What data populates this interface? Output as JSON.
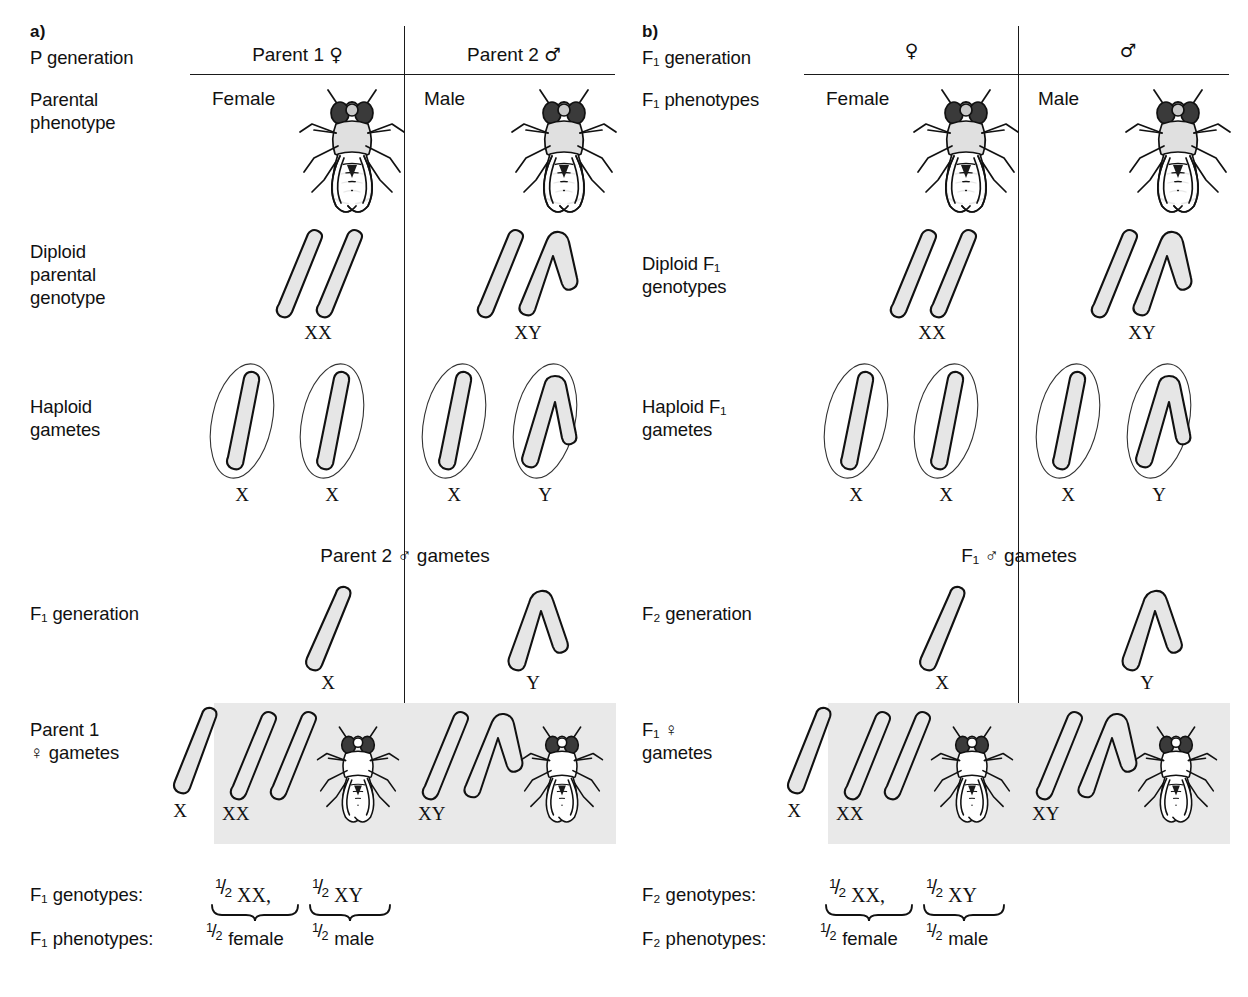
{
  "figure": {
    "background_color": "#ffffff",
    "line_color": "#1a1a1a",
    "punnett_fill": "#e9e9e9",
    "chromosome_fill": "#e3e3e3"
  },
  "panel_a": {
    "letter": "a)",
    "rows": {
      "generation_label": "P generation",
      "phenotype_label": "Parental\nphenotype",
      "diploid_label": "Diploid\nparental\ngenotype",
      "haploid_label": "Haploid\ngametes",
      "cross_generation_label": "F₁ generation",
      "cross_gamete_label": "Parent 1\n♀ gametes"
    },
    "columns": [
      {
        "header_text": "Parent 1",
        "header_symbol": "♀",
        "phenotype": "Female",
        "diploid_genotype": "XX",
        "gametes": [
          "X",
          "X"
        ]
      },
      {
        "header_text": "Parent 2",
        "header_symbol": "♂",
        "phenotype": "Male",
        "diploid_genotype": "XY",
        "gametes": [
          "X",
          "Y"
        ]
      }
    ],
    "punnett": {
      "top_title": "Parent 2 ♂ gametes",
      "top_gametes": [
        "X",
        "Y"
      ],
      "side_gamete": "X",
      "cells": [
        {
          "genotype": "XX",
          "sex": "female"
        },
        {
          "genotype": "XY",
          "sex": "male"
        }
      ]
    },
    "summary": {
      "genotypes_label": "F₁ genotypes:",
      "phenotypes_label": "F₁ phenotypes:",
      "genotypes": [
        {
          "numerator": "1",
          "denominator": "2",
          "text": "XX,"
        },
        {
          "numerator": "1",
          "denominator": "2",
          "text": "XY"
        }
      ],
      "phenotypes": [
        {
          "numerator": "1",
          "denominator": "2",
          "text": "female"
        },
        {
          "numerator": "1",
          "denominator": "2",
          "text": "male"
        }
      ]
    }
  },
  "panel_b": {
    "letter": "b)",
    "rows": {
      "generation_label": "F₁ generation",
      "phenotype_label": "F₁ phenotypes",
      "diploid_label": "Diploid F₁\ngenotypes",
      "haploid_label": "Haploid F₁\ngametes",
      "cross_generation_label": "F₂ generation",
      "cross_gamete_label": "F₁ ♀\ngametes"
    },
    "columns": [
      {
        "header_text": "",
        "header_symbol": "♀",
        "phenotype": "Female",
        "diploid_genotype": "XX",
        "gametes": [
          "X",
          "X"
        ]
      },
      {
        "header_text": "",
        "header_symbol": "♂",
        "phenotype": "Male",
        "diploid_genotype": "XY",
        "gametes": [
          "X",
          "Y"
        ]
      }
    ],
    "punnett": {
      "top_title": "F₁ ♂ gametes",
      "top_gametes": [
        "X",
        "Y"
      ],
      "side_gamete": "X",
      "cells": [
        {
          "genotype": "XX",
          "sex": "female"
        },
        {
          "genotype": "XY",
          "sex": "male"
        }
      ]
    },
    "summary": {
      "genotypes_label": "F₂ genotypes:",
      "phenotypes_label": "F₂ phenotypes:",
      "genotypes": [
        {
          "numerator": "1",
          "denominator": "2",
          "text": "XX,"
        },
        {
          "numerator": "1",
          "denominator": "2",
          "text": "XY"
        }
      ],
      "phenotypes": [
        {
          "numerator": "1",
          "denominator": "2",
          "text": "female"
        },
        {
          "numerator": "1",
          "denominator": "2",
          "text": "male"
        }
      ]
    }
  }
}
